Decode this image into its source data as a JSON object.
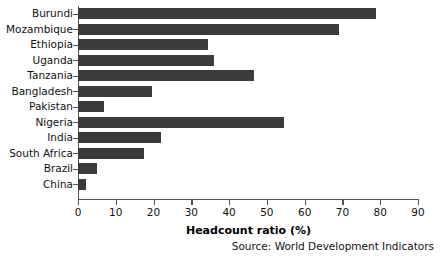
{
  "chart_data": {
    "type": "bar",
    "orientation": "horizontal",
    "title": "",
    "xlabel": "Headcount ratio (%)",
    "ylabel": "",
    "xlim": [
      0,
      90
    ],
    "xticks": [
      0,
      10,
      20,
      30,
      40,
      50,
      60,
      70,
      80,
      90
    ],
    "grid": false,
    "legend": null,
    "bar_color": "#3b3b3b",
    "categories": [
      "Burundi",
      "Mozambique",
      "Ethiopia",
      "Uganda",
      "Tanzania",
      "Bangladesh",
      "Pakistan",
      "Nigeria",
      "India",
      "South Africa",
      "Brazil",
      "China"
    ],
    "values": [
      79,
      69,
      34.5,
      36,
      46.5,
      19.5,
      7,
      54.5,
      22,
      17.5,
      5,
      2
    ],
    "annotations": [
      "Source: World Development Indicators"
    ]
  },
  "footer": {
    "source": "Source: World Development Indicators"
  }
}
